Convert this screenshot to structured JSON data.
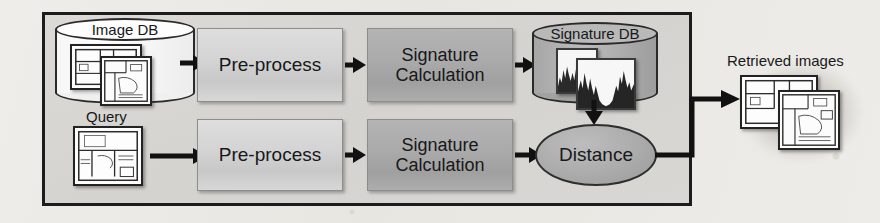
{
  "diagram": {
    "container": {
      "border_color": "#1c1c1c",
      "fill_color": "#d7d5d1"
    },
    "nodes": {
      "image_db": {
        "label": "Image DB",
        "shape": "cylinder",
        "fill": "#ffffff"
      },
      "query": {
        "label": "Query",
        "shape": "image"
      },
      "preprocess_top": {
        "label": "Pre-process",
        "shape": "rect",
        "fill": "#d4d4d4"
      },
      "preprocess_bottom": {
        "label": "Pre-process",
        "shape": "rect",
        "fill": "#d4d4d4"
      },
      "signature_calc_top": {
        "label_line1": "Signature",
        "label_line2": "Calculation",
        "shape": "rect",
        "fill": "#aaaaaa"
      },
      "signature_calc_bottom": {
        "label_line1": "Signature",
        "label_line2": "Calculation",
        "shape": "rect",
        "fill": "#aaaaaa"
      },
      "signature_db": {
        "label": "Signature DB",
        "shape": "cylinder",
        "fill": "#b0b0b0"
      },
      "distance": {
        "label": "Distance",
        "shape": "ellipse",
        "fill": "#ababab"
      },
      "retrieved_images": {
        "label": "Retrieved images",
        "shape": "image-stack"
      }
    },
    "edges": [
      {
        "from": "image_db",
        "to": "preprocess_top",
        "style": "arrow-right"
      },
      {
        "from": "preprocess_top",
        "to": "signature_calc_top",
        "style": "arrow-right"
      },
      {
        "from": "signature_calc_top",
        "to": "signature_db",
        "style": "arrow-right"
      },
      {
        "from": "query",
        "to": "preprocess_bottom",
        "style": "arrow-right"
      },
      {
        "from": "preprocess_bottom",
        "to": "signature_calc_bottom",
        "style": "arrow-right"
      },
      {
        "from": "signature_calc_bottom",
        "to": "distance",
        "style": "arrow-right"
      },
      {
        "from": "signature_db",
        "to": "distance",
        "style": "arrow-down"
      },
      {
        "from": "distance",
        "to": "retrieved_images",
        "style": "arrow-elbow-right"
      }
    ],
    "thumbnail_kinds": {
      "image_db": "floor-plan",
      "query": "floor-plan",
      "signature_db": "histogram",
      "retrieved_images": "floor-plan"
    }
  }
}
